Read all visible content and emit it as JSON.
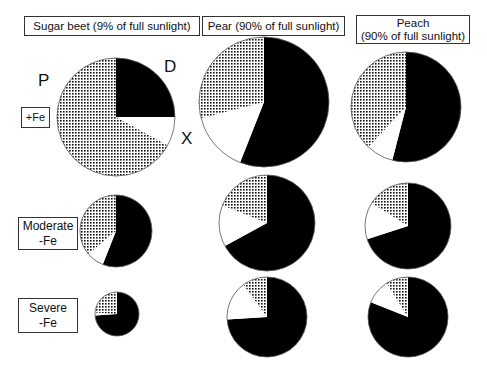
{
  "column_headers": [
    {
      "line1": "Sugar beet (9% of full sunlight)",
      "line2": ""
    },
    {
      "line1": "Pear (90% of full sunlight)",
      "line2": ""
    },
    {
      "line1": "Peach",
      "line2": "(90% of full sunlight)"
    }
  ],
  "row_headers": [
    {
      "line1": "+Fe",
      "line2": ""
    },
    {
      "line1": "Moderate",
      "line2": "-Fe"
    },
    {
      "line1": "Severe",
      "line2": "-Fe"
    }
  ],
  "segment_labels": {
    "P": "P",
    "D": "D",
    "X": "X"
  },
  "colors": {
    "D": "#000000",
    "X": "#ffffff",
    "P": "dotted",
    "outline": "#555555"
  },
  "chart_data": {
    "type": "pie",
    "title": "",
    "legend": [
      {
        "key": "D",
        "fill": "black"
      },
      {
        "key": "X",
        "fill": "white"
      },
      {
        "key": "P",
        "fill": "dotted"
      }
    ],
    "columns": [
      "Sugar beet (9% of full sunlight)",
      "Pear (90% of full sunlight)",
      "Peach (90% of full sunlight)"
    ],
    "rows": [
      "+Fe",
      "Moderate -Fe",
      "Severe -Fe"
    ],
    "pies": [
      {
        "column": "Sugar beet",
        "row": "+Fe",
        "cx": 116,
        "cy": 117,
        "r": 59,
        "values": {
          "D": 25,
          "X": 8,
          "P": 67
        }
      },
      {
        "column": "Sugar beet",
        "row": "Moderate -Fe",
        "cx": 116,
        "cy": 231,
        "r": 36,
        "values": {
          "D": 56,
          "X": 8,
          "P": 36
        }
      },
      {
        "column": "Sugar beet",
        "row": "Severe -Fe",
        "cx": 117,
        "cy": 314,
        "r": 22,
        "values": {
          "D": 74,
          "X": 2,
          "P": 24
        }
      },
      {
        "column": "Pear",
        "row": "+Fe",
        "cx": 264,
        "cy": 102,
        "r": 65,
        "values": {
          "D": 56,
          "X": 15,
          "P": 29
        }
      },
      {
        "column": "Pear",
        "row": "Moderate -Fe",
        "cx": 267,
        "cy": 223,
        "r": 48,
        "values": {
          "D": 67,
          "X": 14,
          "P": 19
        }
      },
      {
        "column": "Pear",
        "row": "Severe -Fe",
        "cx": 267,
        "cy": 317,
        "r": 40,
        "values": {
          "D": 74,
          "X": 16,
          "P": 10
        }
      },
      {
        "column": "Peach",
        "row": "+Fe",
        "cx": 406,
        "cy": 107,
        "r": 55,
        "values": {
          "D": 54,
          "X": 8,
          "P": 38
        }
      },
      {
        "column": "Peach",
        "row": "Moderate -Fe",
        "cx": 408,
        "cy": 226,
        "r": 43,
        "values": {
          "D": 70,
          "X": 14,
          "P": 16
        }
      },
      {
        "column": "Peach",
        "row": "Severe -Fe",
        "cx": 408,
        "cy": 317,
        "r": 40,
        "values": {
          "D": 81,
          "X": 10,
          "P": 9
        }
      }
    ]
  }
}
